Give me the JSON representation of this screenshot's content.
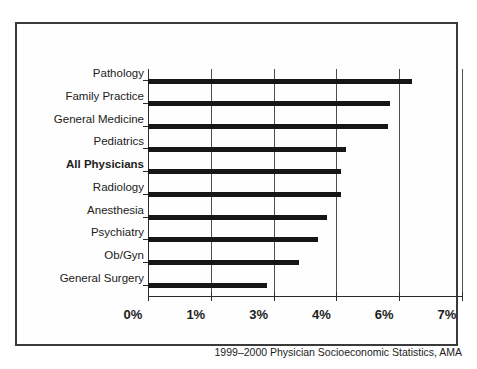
{
  "chart_data": {
    "type": "bar",
    "orientation": "horizontal",
    "title": "",
    "subtitle": "",
    "xlabel": "",
    "ylabel": "",
    "categories": [
      "Pathology",
      "Family Practice",
      "General Medicine",
      "Pediatrics",
      "All Physicians",
      "Radiology",
      "Anesthesia",
      "Psychiatry",
      "Ob/Gyn",
      "General Surgery"
    ],
    "values": [
      6.2,
      5.7,
      5.65,
      4.3,
      4.15,
      4.15,
      3.85,
      3.7,
      3.4,
      2.8
    ],
    "value_unit": "%",
    "emphasized_category": "All Physicians",
    "xlim": [
      0,
      7
    ],
    "xticks": [
      0,
      1,
      3,
      4,
      6,
      7
    ],
    "xtick_labels": [
      "0%",
      "1%",
      "3%",
      "4%",
      "6%",
      "7%"
    ],
    "grid": true,
    "grid_axis": "x",
    "legend": "none",
    "bar_color": "#161616",
    "axis_color": "#2b2b2b",
    "grid_color": "#4d4d4d",
    "background_color": "#ffffff",
    "source_note": "1999–2000 Physician Socioeconomic Statistics, AMA"
  },
  "figure": {
    "source_note": "1999–2000 Physician Socioeconomic Statistics, AMA"
  }
}
